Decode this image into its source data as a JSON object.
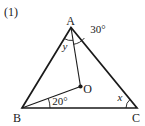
{
  "figure_number": "(1)",
  "points": {
    "A": "A",
    "B": "B",
    "C": "C",
    "O": "O"
  },
  "angle_labels": {
    "OAC": "30°",
    "BAO": "y",
    "OBC": "20°",
    "BCA": "x"
  },
  "colors": {
    "line": "#1a1a1a",
    "background": "#ffffff"
  }
}
